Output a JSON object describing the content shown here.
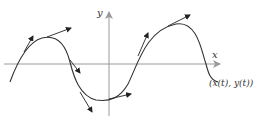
{
  "axes": {
    "x_label": "x",
    "y_label": "y",
    "axis_color": "#9a9a9a"
  },
  "curve": {
    "label": "(x(t), y(t))",
    "color": "#333333"
  },
  "tangent_vectors": {
    "count": 8,
    "color": "#222222"
  }
}
